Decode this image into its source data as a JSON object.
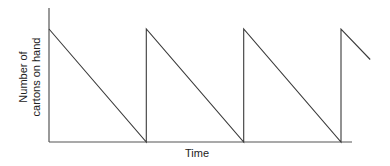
{
  "chart_data": {
    "type": "line",
    "title": "",
    "xlabel": "Time",
    "ylabel_lines": [
      "Number of",
      "cartons on hand"
    ],
    "ylabel": "Number of cartons on hand",
    "grid": false,
    "legend": null,
    "x_ticks": [],
    "y_ticks": [],
    "xlim": [
      0,
      3.3
    ],
    "ylim": [
      0,
      1.18
    ],
    "series": [
      {
        "name": "Inventory level",
        "x": [
          0,
          1,
          1,
          2,
          2,
          3,
          3,
          3.3
        ],
        "y": [
          1,
          0,
          1,
          0,
          1,
          0,
          1,
          0.73
        ]
      }
    ],
    "pixel_geometry": {
      "origin": [
        49,
        142
      ],
      "y_axis_top": 8,
      "x_axis_right": 352,
      "points": [
        [
          49,
          29
        ],
        [
          140,
          142
        ],
        [
          140,
          29
        ],
        [
          241,
          142
        ],
        [
          241,
          29
        ],
        [
          341,
          142
        ],
        [
          341,
          29
        ],
        [
          371,
          59
        ]
      ]
    }
  }
}
